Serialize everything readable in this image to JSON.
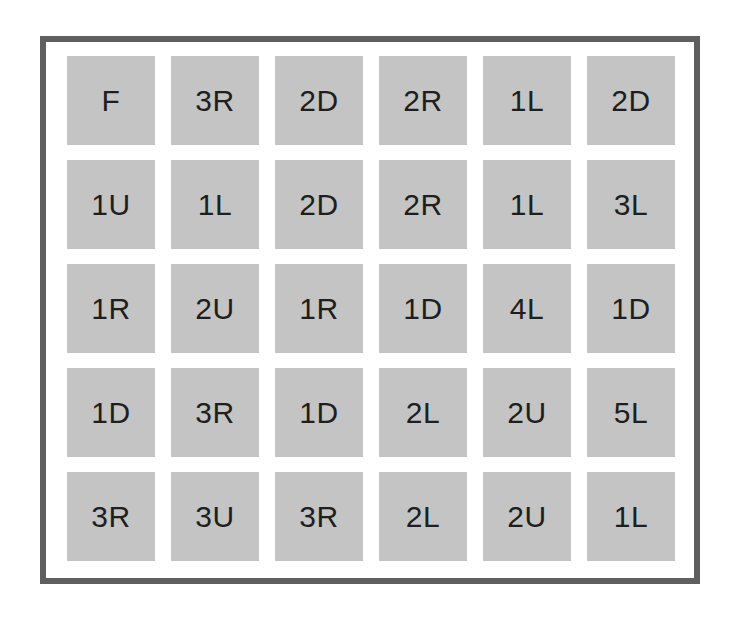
{
  "puzzle": {
    "rows": 5,
    "cols": 6,
    "colors": {
      "border": "#5f5f5f",
      "cell": "#c4c4c4",
      "text": "#1e1e1e",
      "background": "#ffffff"
    },
    "grid": [
      [
        "F",
        "3R",
        "2D",
        "2R",
        "1L",
        "2D"
      ],
      [
        "1U",
        "1L",
        "2D",
        "2R",
        "1L",
        "3L"
      ],
      [
        "1R",
        "2U",
        "1R",
        "1D",
        "4L",
        "1D"
      ],
      [
        "1D",
        "3R",
        "1D",
        "2L",
        "2U",
        "5L"
      ],
      [
        "3R",
        "3U",
        "3R",
        "2L",
        "2U",
        "1L"
      ]
    ]
  }
}
